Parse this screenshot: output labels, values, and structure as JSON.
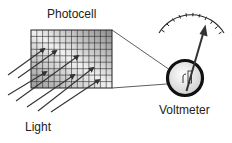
{
  "labels": {
    "photocell": "Photocell",
    "light": "Light",
    "voltmeter": "Voltmeter"
  },
  "icons": [
    "photocell-grid-icon",
    "light-ray-arrow-icon",
    "voltmeter-dial-icon",
    "gauge-scale-icon",
    "needle-icon"
  ],
  "colors": {
    "line": "#1a1a1a",
    "grid_light": "#f2f2f2",
    "grid_dark": "#8a8a8a",
    "dial_fill": "#f4f4f4"
  }
}
